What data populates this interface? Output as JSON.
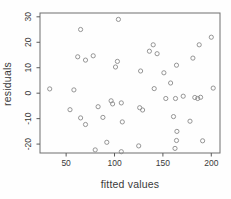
{
  "figure": {
    "background": "#fefefe",
    "box_color": "#6e6e6e",
    "point_color": "#8a8a8a",
    "tick_color": "#5a5a5a",
    "text_color": "#3a3a3a"
  },
  "chart_data": {
    "type": "scatter",
    "title": "",
    "xlabel": "fitted values",
    "ylabel": "residuals",
    "xlim": [
      23,
      209
    ],
    "ylim": [
      -23.5,
      31.5
    ],
    "x_ticks": [
      50,
      100,
      150,
      200
    ],
    "y_ticks": [
      -20,
      -10,
      0,
      10,
      20,
      30
    ],
    "grid": false,
    "legend": null,
    "marker": "open-circle",
    "points": [
      [
        33,
        1.7
      ],
      [
        54,
        -6.5
      ],
      [
        58,
        1.3
      ],
      [
        62,
        14.3
      ],
      [
        65,
        25
      ],
      [
        65,
        -9.7
      ],
      [
        70,
        13
      ],
      [
        70,
        -12.3
      ],
      [
        78,
        14.7
      ],
      [
        80,
        -22.3
      ],
      [
        83,
        -5.3
      ],
      [
        88,
        -9.5
      ],
      [
        92,
        -19.3
      ],
      [
        96.5,
        -3
      ],
      [
        98,
        -4.2
      ],
      [
        101,
        10.3
      ],
      [
        103,
        12.5
      ],
      [
        104,
        29
      ],
      [
        107,
        -3.8
      ],
      [
        108,
        -11.3
      ],
      [
        107,
        -23
      ],
      [
        125,
        -20.7
      ],
      [
        126,
        -5.7
      ],
      [
        129,
        -6.6
      ],
      [
        127,
        8.7
      ],
      [
        136,
        16.5
      ],
      [
        140,
        19
      ],
      [
        141,
        1.8
      ],
      [
        144,
        15.5
      ],
      [
        151,
        8
      ],
      [
        153,
        -2.1
      ],
      [
        158,
        4
      ],
      [
        161,
        -9.2
      ],
      [
        162.5,
        -21.7
      ],
      [
        163,
        -2.1
      ],
      [
        164,
        11
      ],
      [
        164,
        -18.6
      ],
      [
        164.5,
        -15
      ],
      [
        171,
        -1.2
      ],
      [
        178,
        -11
      ],
      [
        181,
        13.8
      ],
      [
        183,
        -1.7
      ],
      [
        186,
        -2.1
      ],
      [
        187.5,
        19
      ],
      [
        189,
        -1.6
      ],
      [
        191,
        -18.7
      ],
      [
        200,
        22
      ],
      [
        202,
        2
      ]
    ]
  }
}
